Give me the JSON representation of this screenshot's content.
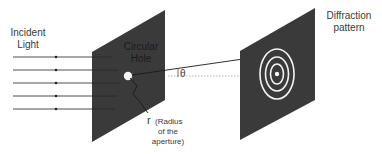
{
  "colors": {
    "panel": "#3a3a3a",
    "ray": "#3a3a3a",
    "ring": "#f2f2f2",
    "background": "#ffffff",
    "text": "#3a3a3a",
    "panel_text": "#1c1c1c"
  },
  "labels": {
    "incident_line1": "Incident",
    "incident_line2": "Light",
    "hole_line1": "Circular",
    "hole_line2": "Hole",
    "theta": "θ",
    "radius_symbol": "r",
    "radius_desc_line1": "(Radius",
    "radius_desc_line2": "of the",
    "radius_desc_line3": "aperture)",
    "pattern_line1": "Diffraction",
    "pattern_line2": "pattern"
  },
  "incident_rays": {
    "count": 5,
    "y_positions": [
      57,
      70,
      83,
      96,
      109
    ]
  },
  "diffraction_rings": {
    "count": 3,
    "center_dot": true
  }
}
